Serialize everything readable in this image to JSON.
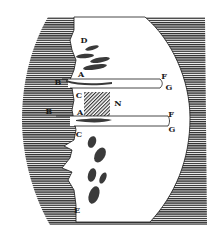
{
  "figure": {
    "colors": {
      "ink": "#1a1a1a",
      "paper": "#ffffff",
      "hatch": "#2b2b2b"
    },
    "labels": [
      {
        "id": "D",
        "text": "D",
        "x": 84,
        "y": 40
      },
      {
        "id": "A1",
        "text": "A",
        "x": 81,
        "y": 74
      },
      {
        "id": "B1",
        "text": "B",
        "x": 58,
        "y": 82
      },
      {
        "id": "F1",
        "text": "F",
        "x": 164,
        "y": 76
      },
      {
        "id": "G1",
        "text": "G",
        "x": 169,
        "y": 87
      },
      {
        "id": "C1",
        "text": "C",
        "x": 79,
        "y": 95
      },
      {
        "id": "N",
        "text": "N",
        "x": 118,
        "y": 103
      },
      {
        "id": "B2",
        "text": "B",
        "x": 49,
        "y": 111
      },
      {
        "id": "A2",
        "text": "A",
        "x": 80,
        "y": 112
      },
      {
        "id": "F2",
        "text": "F",
        "x": 171,
        "y": 114
      },
      {
        "id": "G2",
        "text": "G",
        "x": 172,
        "y": 129
      },
      {
        "id": "C2",
        "text": "C",
        "x": 79,
        "y": 134
      },
      {
        "id": "E",
        "text": "E",
        "x": 77,
        "y": 210
      }
    ]
  }
}
